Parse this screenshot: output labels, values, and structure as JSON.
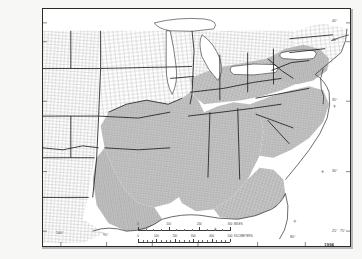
{
  "document": {
    "type": "thematic-county-map",
    "title": "United States county map with shaded southeastern region",
    "plate_number": "1994"
  },
  "map": {
    "projection_note": "conic",
    "frame": {
      "left": 42,
      "top": 8,
      "width": 309,
      "height": 239
    },
    "shaded_region_label": "shaded study area",
    "shade_color": "#c9c9c9",
    "unshaded_color": "#ffffff",
    "county_line_color": "#8e8e8e",
    "state_line_color": "#1f1f1f",
    "coast_line_color": "#2a2a2a"
  },
  "graticule": {
    "latitude_labels": [
      {
        "text": "45°",
        "x": 336,
        "y": 22
      },
      {
        "text": "40°",
        "x": 336,
        "y": 41
      },
      {
        "text": "35°",
        "x": 336,
        "y": 101
      },
      {
        "text": "30°",
        "x": 336,
        "y": 172
      },
      {
        "text": "25°",
        "x": 336,
        "y": 232
      }
    ],
    "longitude_labels": [
      {
        "text": "100°",
        "x": 60,
        "y": 234
      },
      {
        "text": "95°",
        "x": 106,
        "y": 236
      },
      {
        "text": "90°",
        "x": 152,
        "y": 238
      },
      {
        "text": "85°",
        "x": 198,
        "y": 238
      },
      {
        "text": "80°",
        "x": 258,
        "y": 236
      },
      {
        "text": "75°",
        "x": 306,
        "y": 232
      }
    ]
  },
  "scalebar": {
    "miles": {
      "unit_label": "MILES",
      "ticks": [
        "0",
        "100",
        "200",
        "300"
      ],
      "max": 300
    },
    "kilometers": {
      "unit_label": "KILOMETERS",
      "ticks": [
        "0",
        "100",
        "200",
        "300",
        "400",
        "500"
      ],
      "max": 500
    }
  },
  "states": {
    "shaded": [
      "Texas (eastern)",
      "Oklahoma",
      "Arkansas",
      "Louisiana",
      "Missouri (southern)",
      "Mississippi",
      "Alabama",
      "Tennessee",
      "Kentucky",
      "Georgia",
      "Florida (northern)",
      "South Carolina",
      "North Carolina",
      "Virginia",
      "West Virginia",
      "Maryland",
      "Delaware"
    ],
    "unshaded": [
      "Colorado",
      "Kansas",
      "Nebraska",
      "Iowa",
      "Minnesota",
      "Wisconsin",
      "Illinois",
      "Indiana",
      "Ohio",
      "Michigan",
      "Pennsylvania",
      "New York",
      "New Jersey",
      "Connecticut",
      "Rhode Island",
      "Massachusetts",
      "New Mexico",
      "Texas (western)",
      "Missouri (northern)"
    ]
  }
}
